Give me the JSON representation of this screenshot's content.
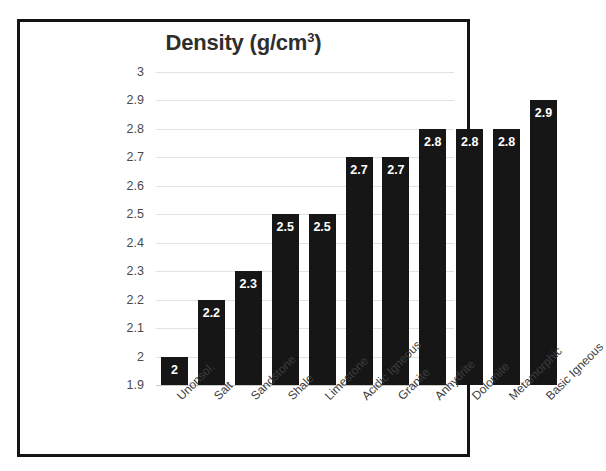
{
  "chart_data": {
    "type": "bar",
    "title_main": "Density (g/cm",
    "title_sup": "3",
    "title_tail": ")",
    "xlabel": "",
    "ylabel": "",
    "ylim": [
      1.9,
      3.0
    ],
    "ytick_step": 0.1,
    "grid": true,
    "legend": "none",
    "bar_color": "#161616",
    "label_color": "#ffffff",
    "gridline_color": "#e2e2e2",
    "categories": [
      "Unonsol.",
      "Salt",
      "Sandstone",
      "Shale",
      "Limestone",
      "Acidic Igneous",
      "Granite",
      "Anhydrite",
      "Dolomite",
      "Metamorphic",
      "Basic Igneous"
    ],
    "values": [
      2,
      2.2,
      2.3,
      2.5,
      2.5,
      2.7,
      2.7,
      2.8,
      2.8,
      2.8,
      2.9
    ],
    "value_labels": [
      "2",
      "2.2",
      "2.3",
      "2.5",
      "2.5",
      "2.7",
      "2.7",
      "2.8",
      "2.8",
      "2.8",
      "2.9"
    ],
    "ytick_labels": [
      "3",
      "2.9",
      "2.8",
      "2.7",
      "2.6",
      "2.5",
      "2.4",
      "2.3",
      "2.2",
      "2.1",
      "2",
      "1.9"
    ],
    "ytick_values": [
      3,
      2.9,
      2.8,
      2.7,
      2.6,
      2.5,
      2.4,
      2.3,
      2.2,
      2.1,
      2,
      1.9
    ]
  }
}
